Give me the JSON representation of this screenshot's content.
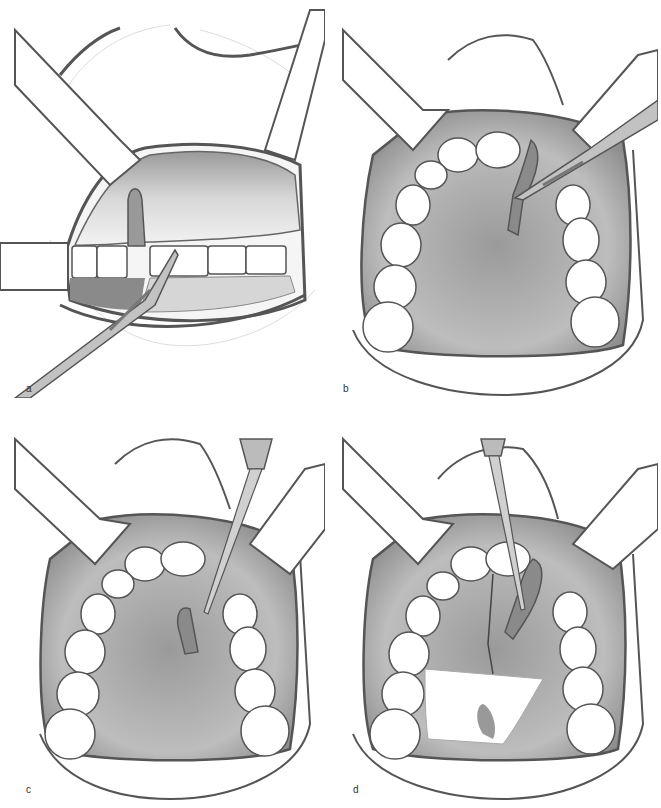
{
  "figure": {
    "panels": [
      {
        "id": "a",
        "label": "a",
        "view": "frontal view of maxillary anterior teeth with incision"
      },
      {
        "id": "b",
        "label": "b",
        "view": "occlusal view of palate with scalpel incision"
      },
      {
        "id": "c",
        "label": "c",
        "view": "occlusal view of palate with elevator reflecting flap"
      },
      {
        "id": "d",
        "label": "d",
        "view": "occlusal view of palate with reflected flap and gauze"
      }
    ]
  },
  "colors": {
    "line": "#555555",
    "tissue_dark": "#8a8a8a",
    "tissue_mid": "#a8a8a8",
    "tissue_light": "#cfcfcf",
    "tooth": "#ffffff",
    "instrument": "#bdbdbd"
  }
}
